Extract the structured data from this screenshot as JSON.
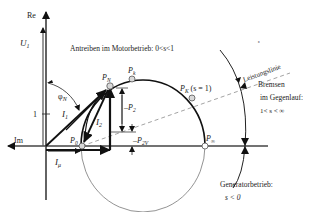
{
  "axes": {
    "re_label": "Re",
    "im_label": "Im",
    "unit_tick_label": "1"
  },
  "vectors": {
    "u1": {
      "symbol": "U",
      "sub": "1"
    },
    "i1": {
      "symbol": "I",
      "sub": "1"
    },
    "i2": {
      "symbol": "I",
      "sub": "2",
      "prime": "'"
    },
    "imu": {
      "symbol": "I",
      "sub": "μ"
    }
  },
  "angle": {
    "symbol": "φ",
    "sub": "N"
  },
  "points": {
    "p0": {
      "symbol": "P",
      "sub": "0"
    },
    "pn": {
      "symbol": "P",
      "sub": "N"
    },
    "pk": {
      "symbol": "P",
      "sub": "k"
    },
    "pK": {
      "symbol": "P",
      "sub": "K",
      "note": "(s = 1)"
    },
    "pinf": {
      "symbol": "P",
      "sub": "∞"
    }
  },
  "powers": {
    "p2": {
      "prefix": "–",
      "symbol": "P",
      "sub": "2"
    },
    "p2v": {
      "prefix": "–",
      "symbol": "P",
      "sub": "2V"
    }
  },
  "annotations": {
    "motor": "Antreiben im Motorbetrieb: 0<s<1",
    "power_line": "Leistungslinie",
    "brake_line1": "Bremsen",
    "brake_line2": "im Gegenlauf:",
    "brake_line3": "1< s < ∞",
    "gen_line1": "Generatorbetrieb:",
    "gen_line2": "s < 0"
  },
  "colors": {
    "ink": "#111111",
    "circle": "#555555",
    "dashed": "#999999",
    "point_fill": "#d9d9d9"
  }
}
